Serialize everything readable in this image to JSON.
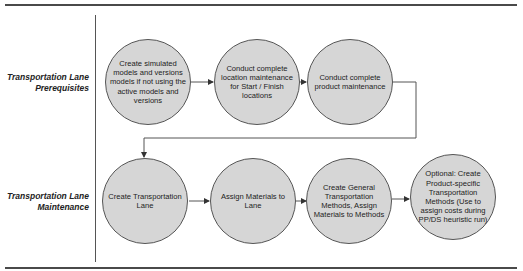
{
  "lanes": [
    {
      "label_line1": "Transportation Lane",
      "label_line2": "Prerequisites"
    },
    {
      "label_line1": "Transportation Lane",
      "label_line2": "Maintenance"
    }
  ],
  "nodes": [
    {
      "id": "n1",
      "text": "Create simulated models and versions models if not using the active models and versions"
    },
    {
      "id": "n2",
      "text": "Conduct complete location maintenance for Start / Finish locations"
    },
    {
      "id": "n3",
      "text": "Conduct complete product maintenance"
    },
    {
      "id": "n4",
      "text": "Create Transportation Lane"
    },
    {
      "id": "n5",
      "text": "Assign Materials to Lane"
    },
    {
      "id": "n6",
      "text": "Create General Transportation Methods, Assign Materials to Methods"
    },
    {
      "id": "n7",
      "text": "Optional: Create Product-specific Transportation Methods (Use to assign costs during PP/DS heuristic run)"
    }
  ],
  "edges": [
    {
      "from": "n1",
      "to": "n2"
    },
    {
      "from": "n2",
      "to": "n3"
    },
    {
      "from": "n3",
      "to": "n4"
    },
    {
      "from": "n4",
      "to": "n5"
    },
    {
      "from": "n5",
      "to": "n6"
    },
    {
      "from": "n6",
      "to": "n7"
    }
  ],
  "colors": {
    "node_fill": "#d6d6d6",
    "line": "#555555",
    "rule": "#4a4a4a"
  }
}
